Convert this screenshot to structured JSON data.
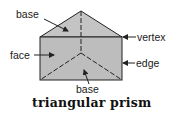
{
  "title": "triangular prism",
  "labels": {
    "base_top": "base",
    "vertex": "vertex",
    "face": "face",
    "edge": "edge",
    "base_bottom": "base"
  },
  "colors": {
    "face_fill": "#bdbdbd",
    "top_fill": "#c4c4c4",
    "stroke": "#222222",
    "text": "#1a1a1a"
  }
}
